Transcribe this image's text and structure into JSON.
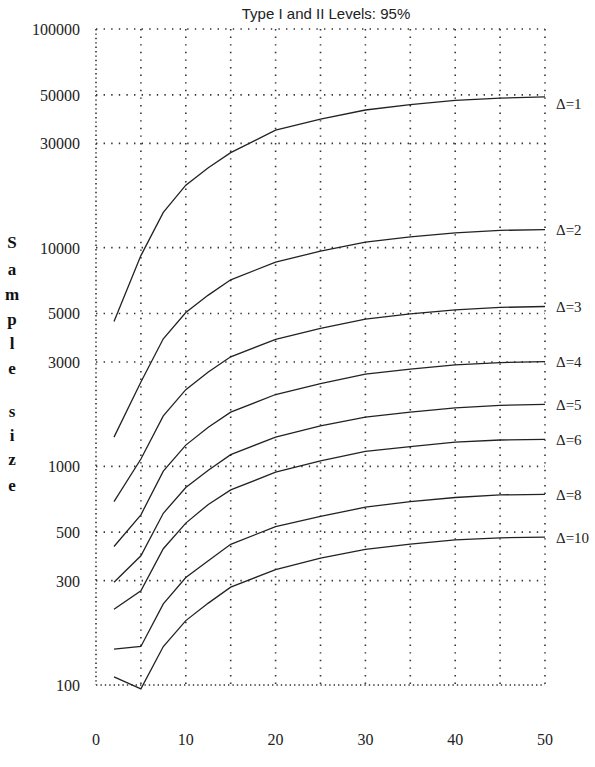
{
  "chart_data": {
    "type": "line",
    "title": "",
    "subtitle": "Type I and II Levels: 95%",
    "xlabel": "",
    "ylabel": "Sample size",
    "xlim": [
      0,
      50
    ],
    "ylim": [
      100,
      100000
    ],
    "yscale": "log",
    "grid": true,
    "legend_position": "right (inline curve labels)",
    "x_ticks": [
      0,
      10,
      20,
      30,
      40,
      50
    ],
    "x_gridlines": [
      5,
      10,
      15,
      20,
      25,
      30,
      35,
      40,
      45
    ],
    "y_ticks": [
      100000,
      50000,
      30000,
      10000,
      5000,
      3000,
      1000,
      500,
      300,
      100
    ],
    "y_tick_labels": [
      "100000",
      "50000",
      "30000",
      "10000",
      "5000",
      "3000",
      "1000",
      "500",
      "300",
      "100"
    ],
    "x": [
      2,
      5,
      7.5,
      10,
      12.5,
      15,
      20,
      25,
      30,
      35,
      40,
      45,
      50
    ],
    "series": [
      {
        "name": "Δ=1",
        "values": [
          4600,
          9200,
          14500,
          19300,
          23200,
          27200,
          34500,
          38700,
          42600,
          45100,
          47200,
          48300,
          48900
        ]
      },
      {
        "name": "Δ=2",
        "values": [
          1360,
          2430,
          3830,
          5050,
          6070,
          7130,
          8580,
          9640,
          10600,
          11200,
          11700,
          12000,
          12100
        ]
      },
      {
        "name": "Δ=3",
        "values": [
          690,
          1080,
          1700,
          2240,
          2700,
          3170,
          3810,
          4280,
          4710,
          4980,
          5200,
          5330,
          5380
        ]
      },
      {
        "name": "Δ=4",
        "values": [
          430,
          600,
          950,
          1250,
          1510,
          1770,
          2130,
          2390,
          2640,
          2780,
          2910,
          2980,
          3010
        ]
      },
      {
        "name": "Δ=5",
        "values": [
          295,
          390,
          610,
          800,
          960,
          1130,
          1360,
          1530,
          1680,
          1770,
          1850,
          1900,
          1920
        ]
      },
      {
        "name": "Δ=6",
        "values": [
          222,
          270,
          420,
          550,
          670,
          780,
          940,
          1060,
          1170,
          1230,
          1290,
          1320,
          1330
        ]
      },
      {
        "name": "Δ=8",
        "values": [
          146,
          150,
          235,
          310,
          370,
          440,
          530,
          590,
          650,
          690,
          720,
          740,
          745
        ]
      },
      {
        "name": "Δ=10",
        "values": [
          109,
          96,
          150,
          197,
          237,
          280,
          337,
          380,
          417,
          441,
          461,
          471,
          474
        ]
      }
    ]
  },
  "labels": {
    "subtitle": "Type I and II Levels: 95%",
    "ylabel_letters": [
      "S",
      "a",
      "m",
      "p",
      "l",
      "e",
      "",
      "s",
      "i",
      "z",
      "e"
    ],
    "y_ticks": [
      "100000",
      "50000",
      "30000",
      "10000",
      "5000",
      "3000",
      "1000",
      "500",
      "300",
      "100"
    ],
    "x_ticks": [
      "0",
      "10",
      "20",
      "30",
      "40",
      "50"
    ],
    "curves": [
      "Δ=1",
      "Δ=2",
      "Δ=3",
      "Δ=4",
      "Δ=5",
      "Δ=6",
      "Δ=8",
      "Δ=10"
    ]
  },
  "colors": {
    "line": "#222222",
    "grid": "#333333",
    "background": "#ffffff"
  }
}
